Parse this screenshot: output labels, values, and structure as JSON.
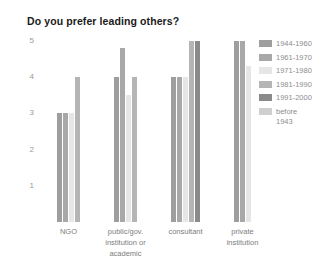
{
  "chart_data": {
    "type": "bar",
    "title": "Do you prefer leading others?",
    "xlabel": "",
    "ylabel": "",
    "ylim": [
      0,
      5
    ],
    "yticks": [
      5,
      4,
      3,
      2,
      1
    ],
    "grid": false,
    "legend_position": "right",
    "categories": [
      "NGO",
      "public/gov.\ninstitution or\nacademic",
      "consultant",
      "private\ninstitution"
    ],
    "series": [
      {
        "name": "1944-1960",
        "color": "#9e9e9e",
        "values": [
          3.0,
          4.0,
          4.0,
          5.0
        ]
      },
      {
        "name": "1961-1970",
        "color": "#a8a8a8",
        "values": [
          3.0,
          4.8,
          4.0,
          5.0
        ]
      },
      {
        "name": "1971-1980",
        "color": "#e6e6e6",
        "values": [
          3.0,
          3.5,
          4.0,
          4.3
        ]
      },
      {
        "name": "1981-1990",
        "color": "#b5b5b5",
        "values": [
          4.0,
          4.0,
          5.0,
          null
        ]
      },
      {
        "name": "1991-2000",
        "color": "#8a8a8a",
        "values": [
          null,
          null,
          5.0,
          null
        ]
      },
      {
        "name": "before\n1943",
        "color": "#cfcfcf",
        "values": [
          null,
          null,
          null,
          null
        ]
      }
    ]
  },
  "legend": {
    "items": [
      {
        "label": "1944-1960",
        "color": "#9e9e9e"
      },
      {
        "label": "1961-1970",
        "color": "#a8a8a8"
      },
      {
        "label": "1971-1980",
        "color": "#e6e6e6"
      },
      {
        "label": "1981-1990",
        "color": "#b5b5b5"
      },
      {
        "label": "1991-2000",
        "color": "#8a8a8a"
      },
      {
        "label": "before\n1943",
        "color": "#cfcfcf"
      }
    ]
  }
}
